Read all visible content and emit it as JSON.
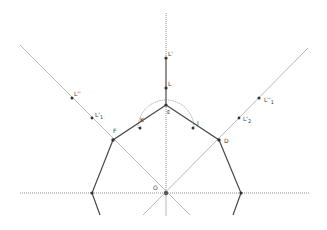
{
  "diagram": {
    "type": "geometric-construction",
    "colors": {
      "solid_line": "#4a4a4a",
      "dotted_line": "#777777",
      "thin_line": "#9a9a9a",
      "point": "#333333",
      "label": "#444444"
    },
    "points": [
      {
        "id": "L_prime",
        "label": "L'",
        "x": 166,
        "y": 58
      },
      {
        "id": "L",
        "label": "L",
        "x": 166,
        "y": 88
      },
      {
        "id": "E",
        "label": "E",
        "x": 166,
        "y": 105
      },
      {
        "id": "K",
        "label": "K",
        "x": 140,
        "y": 128
      },
      {
        "id": "J",
        "label": "J",
        "x": 193,
        "y": 128
      },
      {
        "id": "F",
        "label": "F",
        "x": 113,
        "y": 140
      },
      {
        "id": "D",
        "label": "D",
        "x": 219,
        "y": 140
      },
      {
        "id": "O",
        "label": "O",
        "x": 166,
        "y": 193
      },
      {
        "id": "left_node",
        "label": "",
        "x": 92,
        "y": 193
      },
      {
        "id": "right_node",
        "label": "",
        "x": 241,
        "y": 193
      },
      {
        "id": "L_dprime",
        "label": "L''",
        "x": 72,
        "y": 98
      },
      {
        "id": "L_prime_1",
        "label": "L'1",
        "x": 92,
        "y": 118
      },
      {
        "id": "L_dprime_1",
        "label": "L''1",
        "x": 259,
        "y": 98
      },
      {
        "id": "L_prime_2",
        "label": "L'2",
        "x": 239,
        "y": 118
      }
    ],
    "labels": {
      "L_prime": "L'",
      "L": "L",
      "E": "E",
      "K": "K",
      "J": "J",
      "F": "F",
      "D": "D",
      "O": "O",
      "L_dprime": "L''",
      "L_prime_1": "L'",
      "L_prime_1_sub": "1",
      "L_dprime_1": "L''",
      "L_dprime_1_sub": "1",
      "L_prime_2": "L'",
      "L_prime_2_sub": "2"
    }
  }
}
